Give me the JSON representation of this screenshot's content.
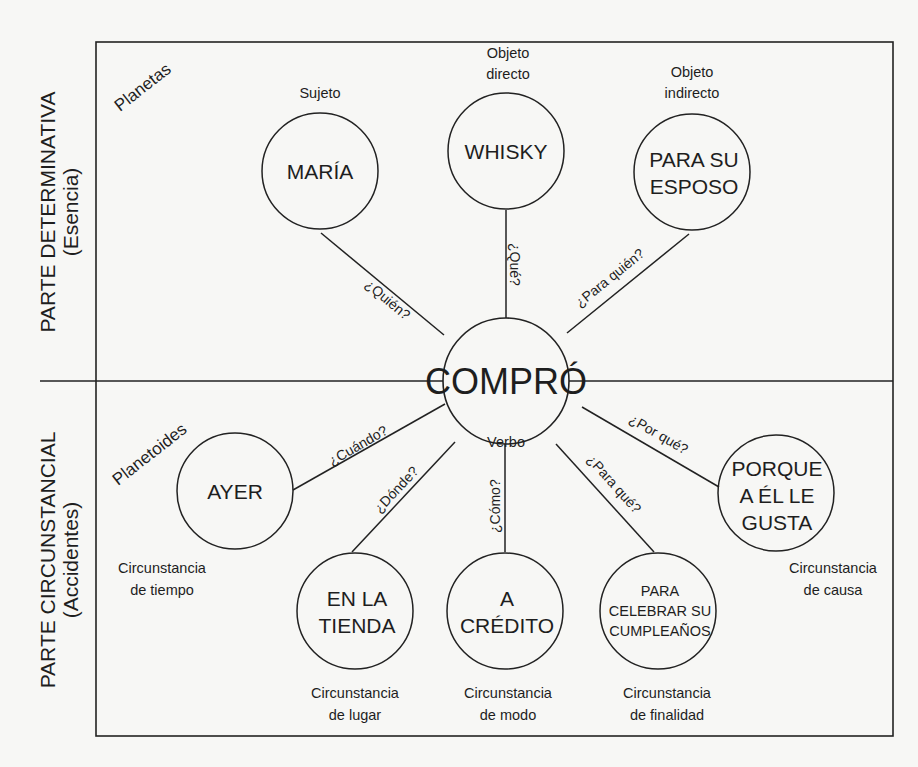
{
  "side_labels": {
    "top": {
      "title": "PARTE DETERMINATIVA",
      "subtitle": "(Esencia)"
    },
    "bottom": {
      "title": "PARTE CIRCUNSTANCIAL",
      "subtitle": "(Accidentes)"
    }
  },
  "groups": {
    "top": "Planetas",
    "bottom": "Planetoides"
  },
  "center": {
    "label": "COMPRÓ",
    "caption": "Verbo"
  },
  "nodes": {
    "maria": {
      "lines": [
        "MARÍA"
      ],
      "caption": [
        "Sujeto"
      ],
      "question": "¿Quién?"
    },
    "whisky": {
      "lines": [
        "WHISKY"
      ],
      "caption": [
        "Objeto",
        "directo"
      ],
      "question": "¿Qué?"
    },
    "esposo": {
      "lines": [
        "PARA SU",
        "ESPOSO"
      ],
      "caption": [
        "Objeto",
        "indirecto"
      ],
      "question": "¿Para quién?"
    },
    "ayer": {
      "lines": [
        "AYER"
      ],
      "caption": [
        "Circunstancia",
        "de tiempo"
      ],
      "question": "¿Cuándo?"
    },
    "tienda": {
      "lines": [
        "EN LA",
        "TIENDA"
      ],
      "caption": [
        "Circunstancia",
        "de lugar"
      ],
      "question": "¿Dónde?"
    },
    "credito": {
      "lines": [
        "A",
        "CRÉDITO"
      ],
      "caption": [
        "Circunstancia",
        "de modo"
      ],
      "question": "¿Cómo?"
    },
    "celebrar": {
      "lines": [
        "PARA",
        "CELEBRAR SU",
        "CUMPLEAÑOS"
      ],
      "caption": [
        "Circunstancia",
        "de finalidad"
      ],
      "question": "¿Para qué?"
    },
    "porque": {
      "lines": [
        "PORQUE",
        "A ÉL LE",
        "GUSTA"
      ],
      "caption": [
        "Circunstancia",
        "de causa"
      ],
      "question": "¿Por qué?"
    }
  }
}
